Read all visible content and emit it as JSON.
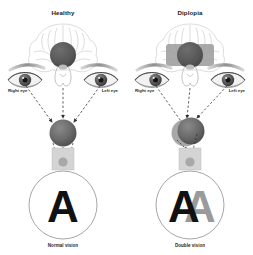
{
  "figure": {
    "title_left": "Healthy",
    "title_right": "Diplopia",
    "background": "#ffffff"
  },
  "panels": [
    {
      "id": "healthy",
      "title": "Healthy",
      "right_eye_label": "Right eye",
      "left_eye_label": "Left eye",
      "vision_label": "Normal vision",
      "letter": "A",
      "letter_ghost": "",
      "aligned": true
    },
    {
      "id": "diplopia",
      "title": "Diplopia",
      "right_eye_label": "Right eye",
      "left_eye_label": "Left eye",
      "vision_label": "Double vision",
      "letter": "A",
      "letter_ghost": "A",
      "aligned": false
    }
  ],
  "colors": {
    "brain_outline": "#c9c9c9",
    "cortex_circle": "#5a5a5a",
    "cortex_band": "#9a9a9a",
    "ball": "#6b6b6b",
    "ball_shadow": "#4a4a4a",
    "screen": "#d2d2d2",
    "arrow": "#3a3a3a",
    "eye_dark": "#4f4f4f",
    "text": "#2a2a2a",
    "letter_primary": "#111111",
    "letter_ghost": "#9a9a9a",
    "circle_outline": "#8f8f8f"
  }
}
